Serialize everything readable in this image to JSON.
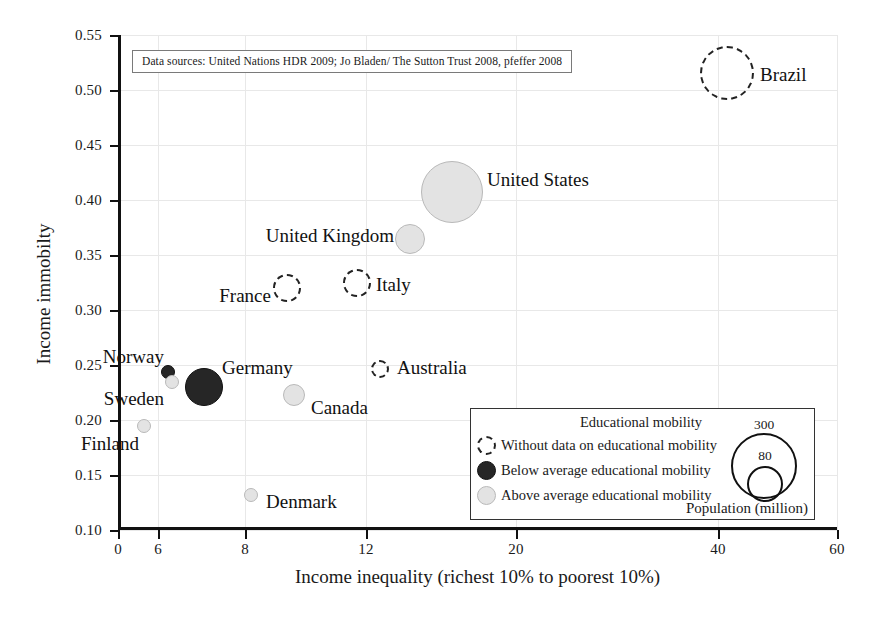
{
  "chart_data": {
    "type": "scatter",
    "title": "",
    "xlabel": "Income inequality (richest 10% to poorest 10%)",
    "ylabel": "Income immobilty",
    "xlim": [
      0,
      60
    ],
    "ylim": [
      0.1,
      0.55
    ],
    "grid": true,
    "x_ticks": [
      {
        "label": "0",
        "value": 0,
        "px": 118
      },
      {
        "label": "6",
        "value": 6,
        "px": 158
      },
      {
        "label": "8",
        "value": 8,
        "px": 245
      },
      {
        "label": "12",
        "value": 12,
        "px": 366
      },
      {
        "label": "20",
        "value": 20,
        "px": 516
      },
      {
        "label": "40",
        "value": 40,
        "px": 718
      },
      {
        "label": "60",
        "value": 60,
        "px": 837
      }
    ],
    "y_ticks": [
      {
        "label": "0.55",
        "value": 0.55,
        "px": 35
      },
      {
        "label": "0.50",
        "value": 0.5,
        "px": 90
      },
      {
        "label": "0.45",
        "value": 0.45,
        "px": 145
      },
      {
        "label": "0.40",
        "value": 0.4,
        "px": 200
      },
      {
        "label": "0.35",
        "value": 0.35,
        "px": 255
      },
      {
        "label": "0.30",
        "value": 0.3,
        "px": 310
      },
      {
        "label": "0.25",
        "value": 0.25,
        "px": 365
      },
      {
        "label": "0.20",
        "value": 0.2,
        "px": 420
      },
      {
        "label": "0.15",
        "value": 0.15,
        "px": 475
      },
      {
        "label": "0.10",
        "value": 0.1,
        "px": 530
      }
    ],
    "bubble_size_encodes": "Population (million)",
    "points": [
      {
        "name": "Brazil",
        "x": 40.0,
        "y": 0.518,
        "population": 195,
        "mobility": "nodata",
        "px": 727,
        "py": 73,
        "r": 27,
        "label_x": 760,
        "label_y": 75,
        "label_align": "rgt"
      },
      {
        "name": "United States",
        "x": 15.9,
        "y": 0.41,
        "population": 310,
        "mobility": "above",
        "px": 452,
        "py": 192,
        "r": 31,
        "label_x": 487,
        "label_y": 180,
        "label_align": "rgt"
      },
      {
        "name": "United Kingdom",
        "x": 13.8,
        "y": 0.37,
        "population": 62,
        "mobility": "above",
        "px": 410,
        "py": 239,
        "r": 15,
        "label_x": 394,
        "label_y": 236,
        "label_align": "lft"
      },
      {
        "name": "Italy",
        "x": 11.6,
        "y": 0.322,
        "population": 60,
        "mobility": "nodata",
        "px": 357,
        "py": 283,
        "r": 14,
        "label_x": 376,
        "label_y": 285,
        "label_align": "rgt"
      },
      {
        "name": "France",
        "x": 9.1,
        "y": 0.32,
        "population": 65,
        "mobility": "nodata",
        "px": 287,
        "py": 288,
        "r": 14,
        "label_x": 271,
        "label_y": 296,
        "label_align": "lft"
      },
      {
        "name": "Australia",
        "x": 12.5,
        "y": 0.246,
        "population": 22,
        "mobility": "nodata",
        "px": 380,
        "py": 369,
        "r": 9,
        "label_x": 397,
        "label_y": 368,
        "label_align": "rgt"
      },
      {
        "name": "Canada",
        "x": 9.4,
        "y": 0.228,
        "population": 34,
        "mobility": "above",
        "px": 294,
        "py": 395,
        "r": 11,
        "label_x": 311,
        "label_y": 408,
        "label_align": "rgt"
      },
      {
        "name": "Germany",
        "x": 6.9,
        "y": 0.235,
        "population": 82,
        "mobility": "below",
        "px": 204,
        "py": 387,
        "r": 19,
        "label_x": 222,
        "label_y": 368,
        "label_align": "rgt"
      },
      {
        "name": "Norway",
        "x": 6.1,
        "y": 0.243,
        "population": 5,
        "mobility": "below",
        "px": 168,
        "py": 372,
        "r": 7,
        "label_x": 164,
        "label_y": 357,
        "label_align": "lft"
      },
      {
        "name": "Sweden",
        "x": 6.2,
        "y": 0.234,
        "population": 9,
        "mobility": "above",
        "px": 172,
        "py": 382,
        "r": 7,
        "label_x": 164,
        "label_y": 399,
        "label_align": "lft"
      },
      {
        "name": "Finland",
        "x": 5.6,
        "y": 0.202,
        "population": 5,
        "mobility": "above",
        "px": 144,
        "py": 426,
        "r": 7,
        "label_x": 139,
        "label_y": 444,
        "label_align": "lft"
      },
      {
        "name": "Denmark",
        "x": 8.1,
        "y": 0.14,
        "population": 6,
        "mobility": "above",
        "px": 251,
        "py": 495,
        "r": 7,
        "label_x": 266,
        "label_y": 502,
        "label_align": "rgt"
      }
    ],
    "annotations": [
      {
        "name": "source-note",
        "text": "Data sources: United Nations HDR 2009; Jo Bladen/ The Sutton Trust 2008, pfeffer 2008"
      }
    ],
    "legend": {
      "position": "bottom-right",
      "title": "Educational mobility",
      "entries": [
        {
          "key": "nodata",
          "label": "Without data on educational mobility"
        },
        {
          "key": "below",
          "label": "Below average educational mobility"
        },
        {
          "key": "above",
          "label": "Above average educational mobility"
        }
      ],
      "size_legend": {
        "caption": "Population (million)",
        "circles": [
          {
            "label": "300",
            "value": 300,
            "px": 763,
            "py": 465,
            "r": 31,
            "label_px": 763,
            "label_py": 424
          },
          {
            "label": "80",
            "value": 80,
            "px": 764,
            "py": 483,
            "r": 16,
            "label_px": 764,
            "label_py": 455
          }
        ]
      }
    },
    "colors": {
      "above_fill": "#e3e3e3",
      "below_fill": "#262626",
      "nodata_stroke": "#222222",
      "axis": "#111111",
      "grid": "#e8e8e8",
      "background": "#ffffff"
    }
  }
}
